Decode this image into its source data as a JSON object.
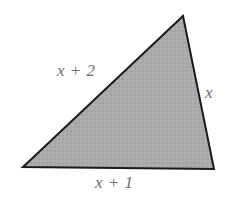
{
  "figure": {
    "name": "shaded-triangle",
    "type": "geometry-diagram",
    "background_color": "#ffffff",
    "fill_color": "#aaaaaa",
    "stroke_color": "#1a1a1a",
    "stroke_width": 2,
    "label_color": "#6d6d6d",
    "vertices": {
      "apex": {
        "x": 183,
        "y": 16
      },
      "bottom_left": {
        "x": 23,
        "y": 167
      },
      "bottom_right": {
        "x": 214,
        "y": 169
      }
    },
    "labels": {
      "hypotenuse": "x + 2",
      "right_side": "x",
      "base": "x + 1"
    }
  }
}
